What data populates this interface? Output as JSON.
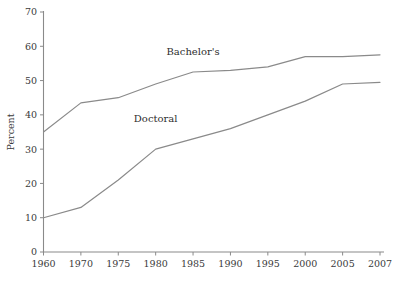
{
  "chart_data": {
    "type": "line",
    "title": "",
    "subtitle": "",
    "xlabel": "",
    "ylabel": "Percent",
    "categories": [
      "1960",
      "1970",
      "1975",
      "1980",
      "1985",
      "1990",
      "1995",
      "2000",
      "2005",
      "2007"
    ],
    "ylim": [
      0,
      70
    ],
    "yticks": [
      0,
      10,
      20,
      30,
      40,
      50,
      60,
      70
    ],
    "ytick_labels": [
      "0",
      "10",
      "20",
      "30",
      "40",
      "50",
      "60",
      "70"
    ],
    "grid": false,
    "legend_position": "inline-annotation",
    "series": [
      {
        "name": "Bachelor's",
        "color": "#8a8a8a",
        "values": [
          35,
          43.5,
          45,
          49,
          52.5,
          53,
          54,
          57,
          57,
          57.5
        ],
        "label_text": "Bachelor's",
        "label_at_category": "1985",
        "label_value": 57.5
      },
      {
        "name": "Doctoral",
        "color": "#8a8a8a",
        "values": [
          10,
          13,
          21,
          30,
          33,
          36,
          40,
          44,
          49,
          49.5
        ],
        "label_text": "Doctoral",
        "label_at_category": "1980",
        "label_value": 38
      }
    ],
    "annotations": [
      {
        "text": "Bachelor's",
        "series": "Bachelor's"
      },
      {
        "text": "Doctoral",
        "series": "Doctoral"
      }
    ]
  },
  "style": {
    "background": "#ffffff",
    "axis_color": "#8a8a8a",
    "text_color": "#3a3a3a",
    "line_color": "#8a8a8a"
  }
}
